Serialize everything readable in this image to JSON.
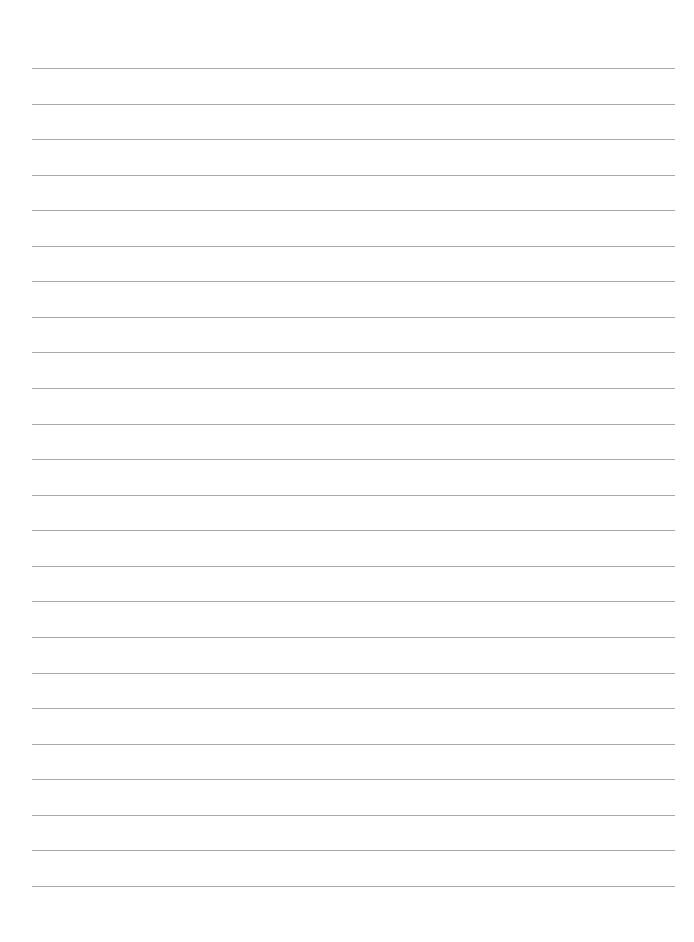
{
  "page": {
    "type": "blank-lined-paper",
    "background_color": "#ffffff",
    "rule_color": "#a9a9a9",
    "rule_count": 24,
    "first_rule_y": 68,
    "rule_spacing": 35.56,
    "rule_left": 32,
    "rule_right": 675
  }
}
